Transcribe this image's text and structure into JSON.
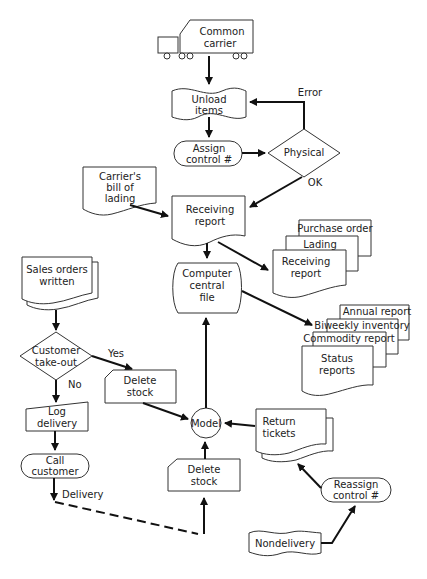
{
  "diagram": {
    "type": "flowchart",
    "nodes": {
      "common_carrier": {
        "line1": "Common",
        "line2": "carrier"
      },
      "unload_items": {
        "line1": "Unload",
        "line2": "items"
      },
      "assign_control": {
        "line1": "Assign",
        "line2": "control #"
      },
      "physical": {
        "label": "Physical"
      },
      "carriers_bill": {
        "line1": "Carrier's",
        "line2": "bill of",
        "line3": "lading"
      },
      "receiving_report": {
        "line1": "Receiving",
        "line2": "report"
      },
      "docs_stack": {
        "back": "Purchase order",
        "middle": "Lading",
        "front1": "Receiving",
        "front2": "report"
      },
      "computer_central_file": {
        "line1": "Computer",
        "line2": "central",
        "line3": "file"
      },
      "reports_stack": {
        "r1": "Annual report",
        "r2": "Biweekly inventory",
        "r3": "Commodity report",
        "front1": "Status",
        "front2": "reports"
      },
      "sales_orders": {
        "line1": "Sales orders",
        "line2": "written"
      },
      "customer_takeout": {
        "line1": "Customer",
        "line2": "take-out"
      },
      "delete_stock_upper": {
        "line1": "Delete",
        "line2": "stock"
      },
      "log_delivery": {
        "line1": "Log",
        "line2": "delivery"
      },
      "call_customer": {
        "line1": "Call",
        "line2": "customer"
      },
      "model": {
        "label": "Model"
      },
      "return_tickets": {
        "line1": "Return",
        "line2": "tickets"
      },
      "delete_stock_lower": {
        "line1": "Delete",
        "line2": "stock"
      },
      "reassign_control": {
        "line1": "Reassign",
        "line2": "control #"
      },
      "nondelivery": {
        "label": "Nondelivery"
      }
    },
    "edge_labels": {
      "error": "Error",
      "ok": "OK",
      "yes": "Yes",
      "no": "No",
      "delivery": "Delivery"
    }
  }
}
